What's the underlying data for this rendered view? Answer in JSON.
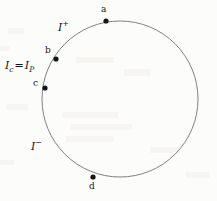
{
  "figure": {
    "width": 217,
    "height": 201,
    "background_color": "#fcfcfb",
    "ink_color": "#151515",
    "curve_color": "#7a7a78"
  },
  "circle": {
    "center_x": 120,
    "center_y": 99,
    "radius": 78,
    "stroke_width": 1,
    "stroke_color": "#82817e"
  },
  "points": [
    {
      "id": "a",
      "label": "a",
      "marker_x": 106,
      "marker_y": 21,
      "label_x": 101,
      "label_y": 5,
      "radius": 2.6
    },
    {
      "id": "b",
      "label": "b",
      "marker_x": 56,
      "marker_y": 59,
      "label_x": 45,
      "label_y": 46,
      "radius": 2.6
    },
    {
      "id": "c",
      "label": "c",
      "marker_x": 45,
      "marker_y": 88,
      "label_x": 33,
      "label_y": 79,
      "radius": 2.6
    },
    {
      "id": "d",
      "label": "d",
      "marker_x": 93,
      "marker_y": 177,
      "label_x": 89,
      "label_y": 182,
      "radius": 2.6
    }
  ],
  "annotations": {
    "scri_plus": {
      "symbol": "I",
      "superscript": "+",
      "full_text": "I+",
      "x": 58,
      "y": 22
    },
    "scri_minus": {
      "symbol": "I",
      "superscript": "−",
      "full_text": "I−",
      "x": 31,
      "y": 141
    },
    "equation": {
      "left_symbol": "I",
      "left_subscript": "c",
      "operator": "=",
      "right_symbol": "I",
      "right_subscript": "P",
      "full_text": "Ic = IP",
      "x": 5,
      "y": 60
    }
  }
}
